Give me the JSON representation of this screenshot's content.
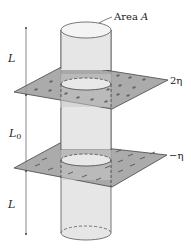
{
  "figure": {
    "labels": {
      "area": "Area A",
      "area_prefix": "Area ",
      "area_var": "A",
      "top_length": "L",
      "middle_length": "L",
      "middle_sub": "0",
      "bottom_length": "L",
      "upper_plane_density": "2η",
      "lower_plane_density": "−η"
    },
    "colors": {
      "cylinder_fill": "#e4e4e4",
      "cylinder_stroke": "#555555",
      "plane_fill": "#9a9a9a",
      "plane_stroke": "#444444",
      "charge_marks": "#555555",
      "dimension_line": "#666666"
    }
  }
}
